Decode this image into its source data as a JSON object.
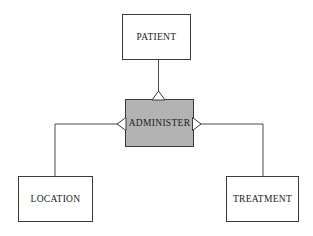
{
  "diagram": {
    "type": "entity-relationship-diagram",
    "background_color": "#ffffff",
    "line_color": "#4a4a4a",
    "border_color": "#3a3a3a",
    "text_color": "#1a1a1a",
    "entities": [
      {
        "id": "patient",
        "label": "PATIENT",
        "shape": "rectangle",
        "fill": "#ffffff",
        "x": 122,
        "y": 14,
        "width": 68,
        "height": 45
      },
      {
        "id": "location",
        "label": "LOCATION",
        "shape": "rectangle",
        "fill": "#ffffff",
        "x": 18,
        "y": 176,
        "width": 74,
        "height": 45
      },
      {
        "id": "treatment",
        "label": "TREATMENT",
        "shape": "rectangle",
        "fill": "#ffffff",
        "x": 226,
        "y": 176,
        "width": 72,
        "height": 45
      }
    ],
    "relationships": [
      {
        "id": "administer",
        "label": "ADMINISTER",
        "shape": "rectangle",
        "fill": "#b3b3b3",
        "x": 125,
        "y": 99,
        "width": 68,
        "height": 47
      }
    ],
    "connections": [
      {
        "id": "patient-administer",
        "from": "patient",
        "to": "administer",
        "marker": "hollow-triangle-up",
        "marker_at": "administer-top"
      },
      {
        "id": "administer-location",
        "from": "administer",
        "to": "location",
        "marker": "hollow-triangle-left",
        "marker_at": "administer-left"
      },
      {
        "id": "administer-treatment",
        "from": "administer",
        "to": "treatment",
        "marker": "hollow-triangle-right",
        "marker_at": "administer-right"
      }
    ]
  }
}
